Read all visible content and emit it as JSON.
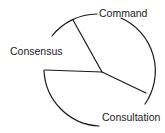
{
  "diagram": {
    "type": "circle-segmented",
    "labels": {
      "command": "Command",
      "consensus": "Consensus",
      "consultation": "Consultation"
    },
    "colors": {
      "stroke": "#1a1a1a",
      "text": "#222222",
      "background": "#ffffff"
    }
  }
}
